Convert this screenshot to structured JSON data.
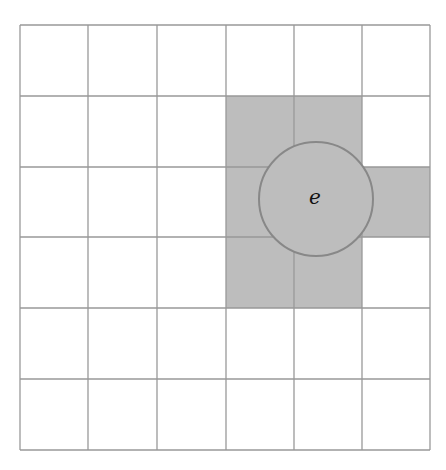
{
  "diagram": {
    "grid": {
      "rows": 6,
      "cols": 6,
      "x_lines": [
        20,
        88,
        157,
        226,
        294,
        362,
        430
      ],
      "y_lines": [
        25,
        96,
        167,
        237,
        308,
        379,
        450
      ],
      "line_color": "#999999",
      "background": "#ffffff"
    },
    "shaded_cells": [
      {
        "row": 1,
        "col": 3
      },
      {
        "row": 1,
        "col": 4
      },
      {
        "row": 2,
        "col": 3
      },
      {
        "row": 2,
        "col": 4
      },
      {
        "row": 2,
        "col": 5
      },
      {
        "row": 3,
        "col": 3
      },
      {
        "row": 3,
        "col": 4
      }
    ],
    "shade_color": "#bdbdbd",
    "circle": {
      "cx": 316,
      "cy": 199,
      "r": 57,
      "fill": "#bdbdbd",
      "stroke": "#888888",
      "label": "e"
    }
  }
}
